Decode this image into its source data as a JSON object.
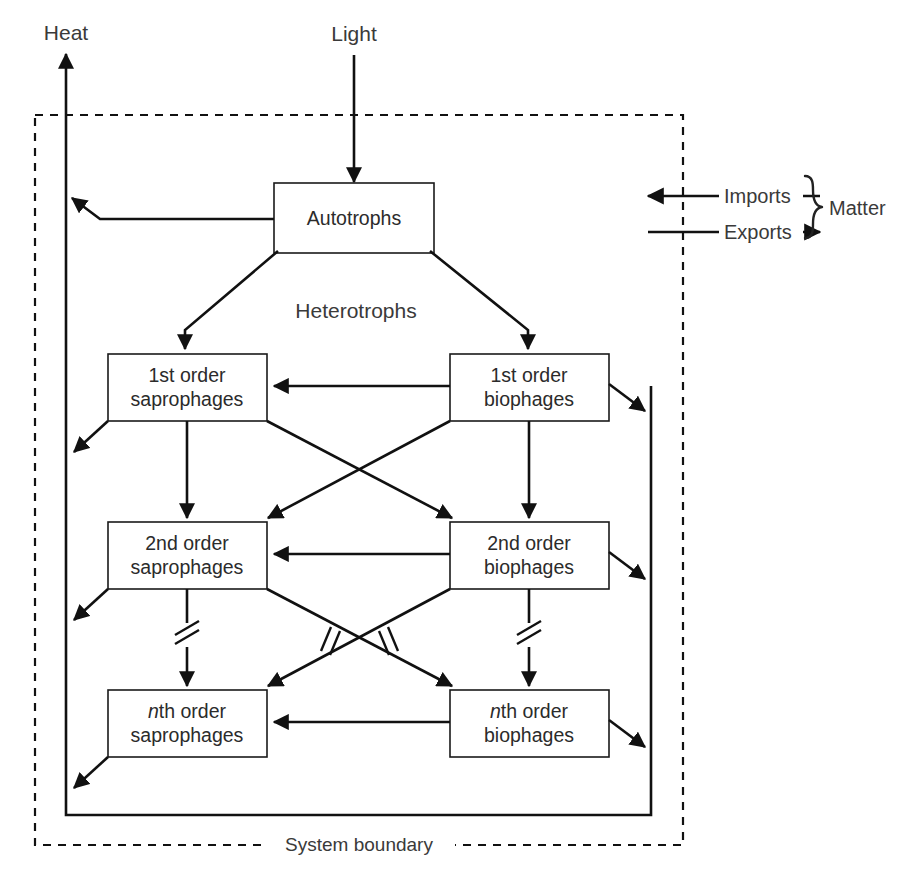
{
  "diagram": {
    "title_labels": {
      "heat": "Heat",
      "light": "Light",
      "heterotrophs": "Heterotrophs",
      "system_boundary": "System boundary"
    },
    "boxes": [
      {
        "id": "autotrophs",
        "line1": "Autotrophs",
        "line2": ""
      },
      {
        "id": "sapro1",
        "line1_prefix": "1st",
        "line1": "1st order",
        "line2": "saprophages"
      },
      {
        "id": "bio1",
        "line1_prefix": "1st",
        "line1": "1st order",
        "line2": "biophages"
      },
      {
        "id": "sapro2",
        "line1_prefix": "2nd",
        "line1": "2nd order",
        "line2": "saprophages"
      },
      {
        "id": "bio2",
        "line1_prefix": "2nd",
        "line1": "2nd order",
        "line2": "biophages"
      },
      {
        "id": "saproN",
        "line1_prefix": "n",
        "line1_suffix": "th order",
        "line2": "saprophages"
      },
      {
        "id": "bioN",
        "line1_prefix": "n",
        "line1_suffix": "th order",
        "line2": "biophages"
      }
    ],
    "legend": {
      "imports": "Imports",
      "exports": "Exports",
      "matter": "Matter"
    },
    "colors": {
      "line": "#111111",
      "text": "#2b2b2b",
      "box_fill": "#ffffff",
      "boundary": "#111111"
    }
  }
}
